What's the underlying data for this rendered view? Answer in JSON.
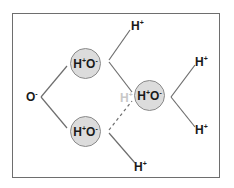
{
  "diagram": {
    "colors": {
      "line": "#6e6e6e",
      "circle_fill": "#dcdcdc",
      "circle_stroke": "#8a8a8a",
      "text": "#1a1a1a",
      "faint_text": "#c8c8c8"
    },
    "nodes": {
      "o_left": {
        "base": "O",
        "charge": "-"
      },
      "hoh_top": {
        "h": "H",
        "h_charge": "+",
        "o": "O",
        "o_charge": "-"
      },
      "hoh_bottom": {
        "h": "H",
        "h_charge": "+",
        "o": "O",
        "o_charge": "-"
      },
      "hoh_right": {
        "h": "H",
        "h_charge": "+",
        "o": "O",
        "o_charge": "-"
      },
      "h_top": {
        "base": "H",
        "charge": "+"
      },
      "h_right_top": {
        "base": "H",
        "charge": "+"
      },
      "h_right_bottom": {
        "base": "H",
        "charge": "+"
      },
      "h_bottom": {
        "base": "H",
        "charge": "+"
      },
      "h_faint": {
        "base": "H",
        "charge": "+"
      }
    }
  }
}
